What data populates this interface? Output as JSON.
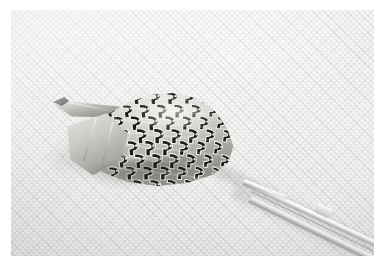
{
  "image": {
    "kind": "macro-photograph",
    "title": "Patterned marine gastropod shell held beside fine forceps",
    "caption": "Close-up photograph of a small cone-shaped sea snail shell with a dark brown hook-and-comma surface pattern, resting on white woven cloth next to the tips of a pair of fine steel forceps.",
    "orientation": "landscape",
    "border_style": "white photographic margin"
  },
  "subjects": {
    "primary": {
      "name": "seashell",
      "label": "Sea snail shell",
      "description": "Conical gastropod shell with pointed siphonal canal to the upper left and a broad rounded body whorl to the right.",
      "pattern": "repeating dark hook / comma markings outlined in cream",
      "surface_tone": "light grey-beige with dark brown markings"
    },
    "secondary": {
      "name": "forceps",
      "label": "Fine forceps",
      "description": "Slender polished steel forceps entering from the lower right, tips angled up toward the shell.",
      "tone": "bright specular white-grey metal"
    },
    "background": {
      "name": "cloth",
      "label": "White woven cloth",
      "description": "Evenly lit textured fabric backdrop with a fine diagonal weave."
    }
  },
  "colors": {
    "frame": "#ffffff",
    "cloth_light": "#fdfdfc",
    "cloth_mid": "#f0efee",
    "cloth_shadow": "#e2e1e0",
    "shell_light": "#eeeeec",
    "shell_mid": "#b6b6b2",
    "shell_dark": "#6f6f6b",
    "pattern_dark": "#191916",
    "metal_light": "#ffffff",
    "metal_dark": "#969694"
  },
  "lighting": {
    "direction": "upper-left, soft diffuse",
    "shadow_note": "soft contact shadow beneath shell and along forceps shafts"
  }
}
